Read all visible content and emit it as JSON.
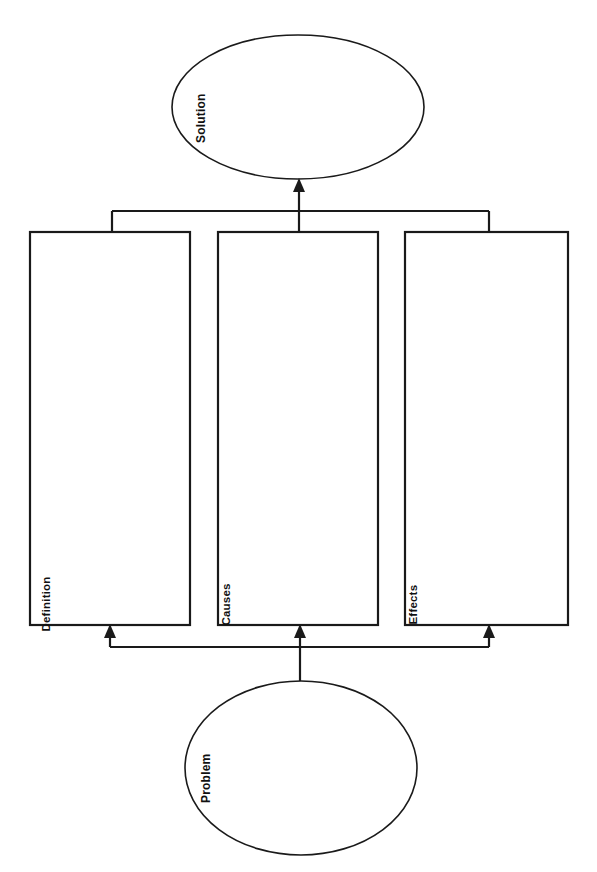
{
  "diagram": {
    "type": "problem-solution graphic organizer",
    "orientation": "rotated 90 degrees (labels read bottom-to-top)",
    "colors": {
      "stroke": "#1a1a1a",
      "fill": "#ffffff",
      "background": "#ffffff"
    },
    "nodes": {
      "solution": {
        "label": "Solution",
        "shape": "ellipse",
        "cx": 298,
        "cy": 107,
        "rx": 126,
        "ry": 72
      },
      "problem": {
        "label": "Problem",
        "shape": "ellipse",
        "cx": 301,
        "cy": 768,
        "rx": 116,
        "ry": 87
      },
      "definition": {
        "label": "Definition",
        "shape": "rectangle",
        "x": 30,
        "y": 232,
        "width": 160,
        "height": 393
      },
      "causes": {
        "label": "Causes",
        "shape": "rectangle",
        "x": 218,
        "y": 232,
        "width": 160,
        "height": 393
      },
      "effects": {
        "label": "Effects",
        "shape": "rectangle",
        "x": 405,
        "y": 232,
        "width": 163,
        "height": 393
      }
    },
    "connectors": [
      {
        "name": "problem-to-definition",
        "from": "problem",
        "to": "definition",
        "arrow": true
      },
      {
        "name": "problem-to-causes",
        "from": "problem",
        "to": "causes",
        "arrow": true
      },
      {
        "name": "problem-to-effects",
        "from": "problem",
        "to": "effects",
        "arrow": true
      },
      {
        "name": "boxes-to-solution",
        "from": "definition,causes,effects",
        "to": "solution",
        "arrow": true
      }
    ]
  }
}
